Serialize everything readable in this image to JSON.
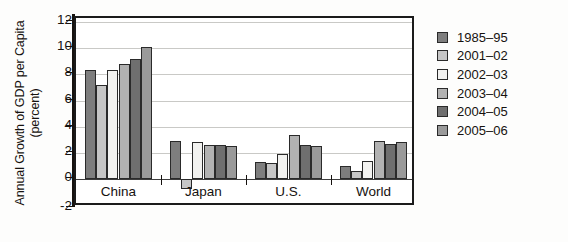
{
  "chart_data": {
    "type": "bar",
    "title": "",
    "subtitle": "",
    "xlabel": "",
    "ylabel": "Annual Growth of GDP per Capita (percent)",
    "categories": [
      "China",
      "Japan",
      "U.S.",
      "World"
    ],
    "ylim": [
      -2,
      12
    ],
    "yticks": [
      12,
      10,
      8,
      6,
      4,
      2,
      0,
      -2
    ],
    "ytick_labels": [
      "12",
      "10",
      "8",
      "6",
      "4",
      "2",
      "0",
      "-2"
    ],
    "grid": true,
    "grid_axis": "y",
    "legend_position": "right",
    "series": [
      {
        "name": "1985–95",
        "color": "#7e7e7e",
        "values": [
          8.3,
          2.9,
          1.3,
          1.0
        ]
      },
      {
        "name": "2001–02",
        "color": "#c6c6c6",
        "values": [
          7.2,
          -0.8,
          1.2,
          0.6
        ]
      },
      {
        "name": "2002–03",
        "color": "#f2f2f0",
        "values": [
          8.35,
          2.8,
          1.9,
          1.4
        ]
      },
      {
        "name": "2003–04",
        "color": "#b2b2b2",
        "values": [
          8.8,
          2.6,
          3.4,
          2.9
        ]
      },
      {
        "name": "2004–05",
        "color": "#6f6f6f",
        "values": [
          9.2,
          2.6,
          2.6,
          2.7
        ]
      },
      {
        "name": "2005–06",
        "color": "#9a9a9a",
        "values": [
          10.1,
          2.5,
          2.5,
          2.8
        ]
      }
    ]
  },
  "legend": {
    "items": [
      {
        "label": "1985–95",
        "color": "#7e7e7e"
      },
      {
        "label": "2001–02",
        "color": "#c6c6c6"
      },
      {
        "label": "2002–03",
        "color": "#f2f2f0"
      },
      {
        "label": "2003–04",
        "color": "#b2b2b2"
      },
      {
        "label": "2004–05",
        "color": "#6f6f6f"
      },
      {
        "label": "2005–06",
        "color": "#9a9a9a"
      }
    ]
  }
}
